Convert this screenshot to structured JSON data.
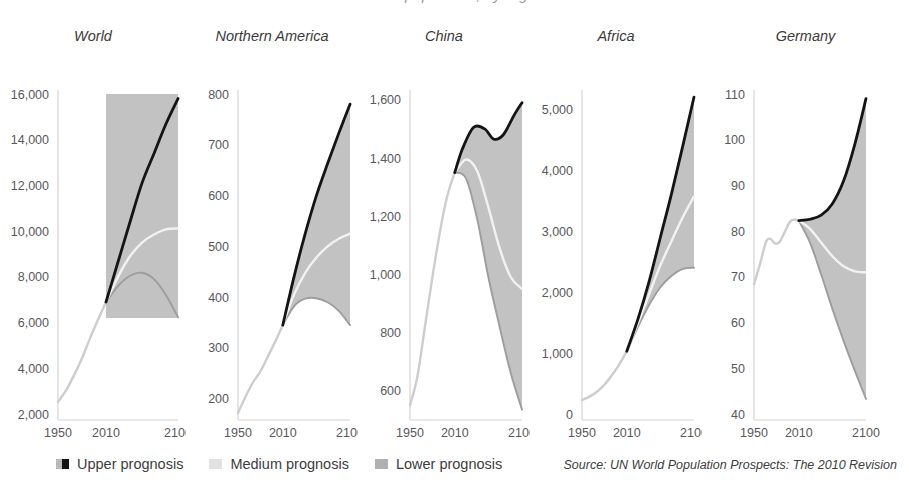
{
  "title": "World population, by region",
  "legend": {
    "items": [
      {
        "label": "Upper prognosis",
        "color": "#141414",
        "style": "split"
      },
      {
        "label": "Medium prognosis",
        "color": "#e2e2e2",
        "style": "solid"
      },
      {
        "label": "Lower prognosis",
        "color": "#b0b0b0",
        "style": "solid"
      }
    ]
  },
  "source": "Source: UN World Population Prospects: The 2010 Revision",
  "colors": {
    "upper": "#141414",
    "medium": "#f2f2f2",
    "lower": "#9d9d9d",
    "historical": "#cdcdcd",
    "band": "#c2c2c2",
    "axis": "#d4d4d4",
    "tick_text": "#58585a"
  },
  "chart_data": {
    "type": "line",
    "title": "World population, by region",
    "xlabel": "",
    "ylabel": "Population (millions)",
    "grid": false,
    "legend_position": "bottom-left",
    "xlim": [
      1950,
      2100
    ],
    "xticks": [
      1950,
      2010,
      2100
    ],
    "panels": [
      {
        "name": "World",
        "ylim": [
          2000,
          16000
        ],
        "yticks": [
          2000,
          4000,
          6000,
          8000,
          10000,
          12000,
          14000,
          16000
        ],
        "ytick_labels": [
          "2,000",
          "4,000",
          "6,000",
          "8,000",
          "10,000",
          "12,000",
          "14,000",
          "16,000"
        ],
        "band_style": "rectangle",
        "band_rect": {
          "x0": 2010,
          "x1": 2100,
          "y0": 6200,
          "y1": 16000
        },
        "series": [
          {
            "name": "Historical",
            "x": [
              1950,
              1960,
              1970,
              1980,
              1990,
              2000,
              2010
            ],
            "values": [
              2530,
              3030,
              3690,
              4440,
              5310,
              6120,
              6900
            ]
          },
          {
            "name": "Upper prognosis",
            "x": [
              2010,
              2025,
              2040,
              2055,
              2070,
              2085,
              2100
            ],
            "values": [
              6900,
              8650,
              10400,
              12100,
              13400,
              14700,
              15800
            ]
          },
          {
            "name": "Medium prognosis",
            "x": [
              2010,
              2025,
              2040,
              2055,
              2070,
              2085,
              2100
            ],
            "values": [
              6900,
              8000,
              8900,
              9500,
              9850,
              10080,
              10120
            ]
          },
          {
            "name": "Lower prognosis",
            "x": [
              2010,
              2025,
              2040,
              2055,
              2070,
              2085,
              2100
            ],
            "values": [
              6900,
              7600,
              8050,
              8180,
              7900,
              7200,
              6230
            ]
          }
        ]
      },
      {
        "name": "Northern America",
        "ylim": [
          170,
          800
        ],
        "yticks": [
          200,
          300,
          400,
          500,
          600,
          700,
          800
        ],
        "ytick_labels": [
          "200",
          "300",
          "400",
          "500",
          "600",
          "700",
          "800"
        ],
        "band_style": "envelope",
        "series": [
          {
            "name": "Historical",
            "x": [
              1950,
              1960,
              1970,
              1980,
              1990,
              2000,
              2010
            ],
            "values": [
              172,
              204,
              232,
              254,
              283,
              313,
              345
            ]
          },
          {
            "name": "Upper prognosis",
            "x": [
              2010,
              2025,
              2040,
              2055,
              2070,
              2085,
              2100
            ],
            "values": [
              345,
              440,
              525,
              600,
              663,
              723,
              780
            ]
          },
          {
            "name": "Medium prognosis",
            "x": [
              2010,
              2025,
              2040,
              2055,
              2070,
              2085,
              2100
            ],
            "values": [
              345,
              405,
              448,
              478,
              500,
              515,
              525
            ]
          },
          {
            "name": "Lower prognosis",
            "x": [
              2010,
              2025,
              2040,
              2055,
              2070,
              2085,
              2100
            ],
            "values": [
              345,
              382,
              397,
              398,
              390,
              373,
              345
            ]
          }
        ]
      },
      {
        "name": "China",
        "ylim": [
          520,
          1620
        ],
        "yticks": [
          600,
          800,
          1000,
          1200,
          1400,
          1600
        ],
        "ytick_labels": [
          "600",
          "800",
          "1,000",
          "1,200",
          "1,400",
          "1,600"
        ],
        "band_style": "envelope",
        "series": [
          {
            "name": "Historical",
            "x": [
              1950,
              1960,
              1970,
              1980,
              1990,
              2000,
              2010
            ],
            "values": [
              550,
              650,
              820,
              990,
              1145,
              1270,
              1350
            ]
          },
          {
            "name": "Upper prognosis",
            "x": [
              2010,
              2020,
              2035,
              2050,
              2062,
              2075,
              2090,
              2100
            ],
            "values": [
              1350,
              1430,
              1505,
              1500,
              1465,
              1480,
              1550,
              1590
            ]
          },
          {
            "name": "Medium prognosis",
            "x": [
              2010,
              2025,
              2040,
              2055,
              2070,
              2085,
              2100
            ],
            "values": [
              1350,
              1395,
              1355,
              1230,
              1090,
              990,
              950
            ]
          },
          {
            "name": "Lower prognosis",
            "x": [
              2010,
              2025,
              2040,
              2055,
              2070,
              2085,
              2100
            ],
            "values": [
              1350,
              1330,
              1190,
              990,
              820,
              660,
              535
            ]
          }
        ]
      },
      {
        "name": "Africa",
        "ylim": [
          0,
          5250
        ],
        "yticks": [
          0,
          1000,
          2000,
          3000,
          4000,
          5000
        ],
        "ytick_labels": [
          "0",
          "1,000",
          "2,000",
          "3,000",
          "4,000",
          "5,000"
        ],
        "band_style": "envelope",
        "series": [
          {
            "name": "Historical",
            "x": [
              1950,
              1960,
              1970,
              1980,
              1990,
              2000,
              2010
            ],
            "values": [
              230,
              285,
              366,
              480,
              635,
              815,
              1030
            ]
          },
          {
            "name": "Upper prognosis",
            "x": [
              2010,
              2025,
              2040,
              2055,
              2070,
              2085,
              2100
            ],
            "values": [
              1030,
              1560,
              2180,
              2900,
              3620,
              4400,
              5200
            ]
          },
          {
            "name": "Medium prognosis",
            "x": [
              2010,
              2025,
              2040,
              2055,
              2070,
              2085,
              2100
            ],
            "values": [
              1030,
              1490,
              1970,
              2440,
              2840,
              3230,
              3570
            ]
          },
          {
            "name": "Lower prognosis",
            "x": [
              2010,
              2025,
              2040,
              2055,
              2070,
              2085,
              2100
            ],
            "values": [
              1030,
              1430,
              1790,
              2080,
              2270,
              2380,
              2400
            ]
          }
        ]
      },
      {
        "name": "Germany",
        "ylim": [
          40,
          110
        ],
        "yticks": [
          40,
          50,
          60,
          70,
          80,
          90,
          100,
          110
        ],
        "ytick_labels": [
          "40",
          "50",
          "60",
          "70",
          "80",
          "90",
          "100",
          "110"
        ],
        "band_style": "envelope",
        "series": [
          {
            "name": "Historical",
            "x": [
              1950,
              1958,
              1966,
              1972,
              1978,
              1984,
              1990,
              1998,
              2004,
              2010
            ],
            "values": [
              68.4,
              72.8,
              77.6,
              78.3,
              77.3,
              77.6,
              79.4,
              82.0,
              82.5,
              82.3
            ]
          },
          {
            "name": "Upper prognosis",
            "x": [
              2010,
              2025,
              2040,
              2055,
              2070,
              2085,
              2100
            ],
            "values": [
              82.3,
              82.6,
              83.5,
              86.0,
              91.0,
              99.0,
              109.0
            ]
          },
          {
            "name": "Medium prognosis",
            "x": [
              2010,
              2025,
              2040,
              2055,
              2070,
              2085,
              2100
            ],
            "values": [
              82.3,
              80.5,
              77.5,
              74.5,
              72.3,
              71.2,
              71.0
            ]
          },
          {
            "name": "Lower prognosis",
            "x": [
              2010,
              2025,
              2040,
              2055,
              2070,
              2085,
              2100
            ],
            "values": [
              82.3,
              77.5,
              70.5,
              63.0,
              56.0,
              49.5,
              43.3
            ]
          }
        ]
      }
    ]
  }
}
